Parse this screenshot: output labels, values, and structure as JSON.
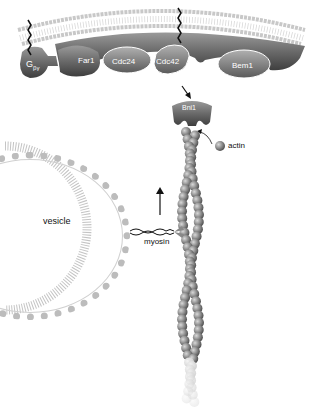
{
  "diagram": {
    "proteins": [
      {
        "id": "gbg",
        "label": "G",
        "sub": "βγ"
      },
      {
        "id": "far1",
        "label": "Far1"
      },
      {
        "id": "cdc24",
        "label": "Cdc24"
      },
      {
        "id": "cdc42",
        "label": "Cdc42"
      },
      {
        "id": "bem1",
        "label": "Bem1"
      },
      {
        "id": "bni1",
        "label": "Bni1"
      }
    ],
    "labels": {
      "actin": "actin",
      "vesicle": "vesicle",
      "myosin": "myosin"
    },
    "colors": {
      "membrane": "#bdbdbd",
      "protein_dark": "#555555",
      "protein_mid": "#7a7a7a",
      "actin": "#8a8a8a"
    }
  }
}
